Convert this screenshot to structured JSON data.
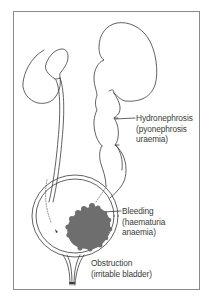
{
  "diagram": {
    "type": "anatomical-illustration",
    "colors": {
      "outline": "#3a3a3a",
      "tumour": "#6e6e6e",
      "frame": "#8a8a8a",
      "text": "#3a3a3a"
    },
    "labels": [
      {
        "id": "hydronephrosis",
        "lines": [
          "Hydronephrosis",
          "(pyonephrosis",
          "uraemia)"
        ]
      },
      {
        "id": "bleeding",
        "lines": [
          "Bleeding",
          "(haematuria",
          "anaemia)"
        ]
      },
      {
        "id": "obstruction",
        "lines": [
          "Obstruction",
          "(irritable bladder)"
        ]
      }
    ]
  }
}
